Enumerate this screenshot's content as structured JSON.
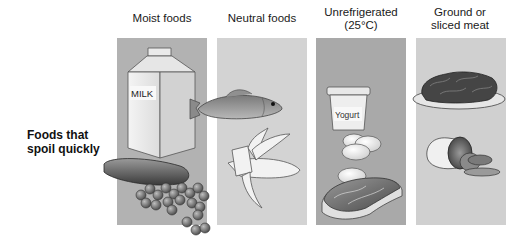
{
  "columns": [
    {
      "title": "Moist foods",
      "panel_color": "#b2b2b2"
    },
    {
      "title": "Neutral foods",
      "panel_color": "#d3d3d3"
    },
    {
      "title": "Unrefrigerated (25°C)",
      "title_line1": "Unrefrigerated",
      "title_line2": "(25°C)",
      "panel_color": "#a9a9a9"
    },
    {
      "title": "Ground or sliced meat",
      "title_line1": "Ground or",
      "title_line2": "sliced meat",
      "panel_color": "#d0d0d0"
    }
  ],
  "row_label": {
    "line1": "Foods that",
    "line2": "spoil quickly"
  },
  "items": {
    "milk_label": "MILK",
    "yogurt_label": "Yogurt",
    "illustrations": [
      "milk-carton",
      "fish",
      "cucumber",
      "grapes",
      "banana",
      "yogurt-cup",
      "eggs",
      "steak",
      "ground-meat-plate",
      "sliced-meat-roll"
    ]
  }
}
